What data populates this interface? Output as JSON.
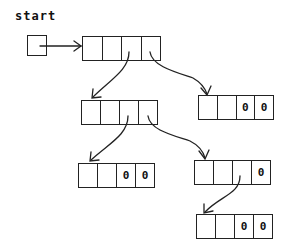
{
  "diagram": {
    "type": "linked-tree",
    "start_label": "start",
    "nodes": [
      {
        "id": "n1",
        "cells": [
          "",
          "",
          "",
          ""
        ],
        "x": 82,
        "y": 36,
        "w": 79
      },
      {
        "id": "n2",
        "cells": [
          "",
          "",
          "",
          ""
        ],
        "x": 81,
        "y": 100,
        "w": 77
      },
      {
        "id": "n3",
        "cells": [
          "",
          "",
          "0",
          "0"
        ],
        "x": 198,
        "y": 95,
        "w": 76
      },
      {
        "id": "n4",
        "cells": [
          "",
          "",
          "0",
          "0"
        ],
        "x": 78,
        "y": 163,
        "w": 77
      },
      {
        "id": "n5",
        "cells": [
          "",
          "",
          "",
          "0"
        ],
        "x": 194,
        "y": 160,
        "w": 77
      },
      {
        "id": "n6",
        "cells": [
          "",
          "",
          "0",
          "0"
        ],
        "x": 196,
        "y": 214,
        "w": 77
      }
    ],
    "edges": [
      {
        "from": "start",
        "to": "n1"
      },
      {
        "from": "n1.cell3",
        "to": "n2"
      },
      {
        "from": "n1.cell4",
        "to": "n3"
      },
      {
        "from": "n2.cell3",
        "to": "n4"
      },
      {
        "from": "n2.cell4",
        "to": "n5"
      },
      {
        "from": "n5.cell3",
        "to": "n6"
      }
    ]
  }
}
